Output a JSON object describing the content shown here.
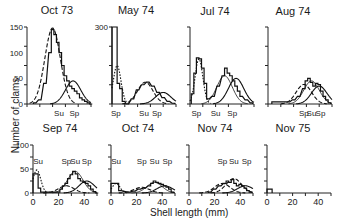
{
  "chart_data": {
    "type": "line",
    "title": "",
    "xlabel": "Shell length (mm)",
    "ylabel": "Number of clams",
    "layout": "2x4 small multiples (length-frequency histograms with fitted normal curves)",
    "xlim": [
      0,
      50
    ],
    "x_ticks": [
      0,
      20,
      40
    ],
    "legend": "none; curves labeled by cohort: Sp (spring), Su (summer)",
    "panels": [
      {
        "title": "Oct 73",
        "ylim": [
          0,
          150
        ],
        "y_ticks": [
          0,
          50,
          100,
          150
        ],
        "cohort_labels": [
          "Su",
          "Sp"
        ],
        "histogram": {
          "x": [
            6,
            10,
            14,
            18,
            20,
            22,
            24,
            26,
            28,
            30,
            32,
            34,
            36,
            38,
            40,
            42,
            44,
            46,
            48,
            50
          ],
          "y": [
            2,
            8,
            40,
            100,
            145,
            135,
            120,
            100,
            75,
            55,
            45,
            35,
            30,
            25,
            20,
            12,
            8,
            5,
            2,
            0
          ]
        },
        "fitted_curves": [
          {
            "cohort": "Su",
            "style": "dashed",
            "mean": 20,
            "peak": 148
          },
          {
            "cohort": "Sp",
            "style": "solid",
            "mean": 36,
            "peak": 45
          }
        ]
      },
      {
        "title": "May 74",
        "ylim": [
          0,
          300
        ],
        "y_ticks": [
          300
        ],
        "axis_break": true,
        "cohort_labels": [
          "Sp",
          "Su",
          "Sp"
        ],
        "histogram": {
          "x": [
            1,
            3,
            5,
            7,
            9,
            12,
            16,
            20,
            24,
            28,
            32,
            36,
            40,
            44,
            48
          ],
          "y": [
            300,
            300,
            80,
            60,
            10,
            0,
            20,
            55,
            75,
            85,
            70,
            45,
            25,
            10,
            3
          ]
        },
        "fitted_curves": [
          {
            "cohort": "Sp",
            "style": "dotted",
            "mean": 4,
            "peak": 150
          },
          {
            "cohort": "Su",
            "style": "dashed",
            "mean": 26,
            "peak": 85
          },
          {
            "cohort": "Sp",
            "style": "solid",
            "mean": 40,
            "peak": 45
          }
        ]
      },
      {
        "title": "Jul 74",
        "ylim": [
          0,
          150
        ],
        "y_ticks": [
          0,
          50,
          100,
          150
        ],
        "cohort_labels": [
          "Sp",
          "Su",
          "Sp"
        ],
        "histogram": {
          "x": [
            2,
            4,
            6,
            8,
            10,
            12,
            14,
            18,
            22,
            26,
            28,
            30,
            32,
            34,
            36,
            38,
            40,
            44,
            48
          ],
          "y": [
            20,
            60,
            90,
            88,
            70,
            40,
            10,
            15,
            35,
            55,
            70,
            60,
            55,
            45,
            35,
            25,
            15,
            8,
            2
          ]
        },
        "fitted_curves": [
          {
            "cohort": "Sp",
            "style": "dotted",
            "mean": 7,
            "peak": 88
          },
          {
            "cohort": "Su",
            "style": "thin-solid",
            "mean": 27,
            "peak": 55
          },
          {
            "cohort": "Sp",
            "style": "solid",
            "mean": 36,
            "peak": 50
          }
        ]
      },
      {
        "title": "Aug 74",
        "ylim": [
          0,
          150
        ],
        "y_ticks": [
          0,
          50,
          100,
          150
        ],
        "cohort_labels": [
          "Sp",
          "Su",
          "Sp"
        ],
        "histogram": {
          "x": [
            4,
            8,
            12,
            16,
            20,
            24,
            28,
            30,
            32,
            34,
            36,
            38,
            40,
            42,
            44,
            46,
            48
          ],
          "y": [
            4,
            4,
            4,
            4,
            8,
            15,
            30,
            45,
            50,
            42,
            35,
            40,
            38,
            25,
            15,
            8,
            2
          ]
        },
        "fitted_curves": [
          {
            "cohort": "Sp",
            "style": "dashed",
            "mean": 28,
            "peak": 38
          },
          {
            "cohort": "Su",
            "style": "thin-solid",
            "mean": 34,
            "peak": 45
          },
          {
            "cohort": "Sp",
            "style": "solid",
            "mean": 40,
            "peak": 35
          }
        ]
      },
      {
        "title": "Sep 74",
        "ylim": [
          0,
          100
        ],
        "y_ticks": [
          0,
          50,
          100
        ],
        "cohort_labels": [
          "Su",
          "Sp",
          "Su",
          "Sp"
        ],
        "histogram": {
          "x": [
            1,
            3,
            5,
            7,
            20,
            22,
            24,
            26,
            28,
            30,
            32,
            34,
            36,
            38,
            40,
            42,
            44,
            46,
            48,
            50
          ],
          "y": [
            40,
            40,
            10,
            2,
            2,
            8,
            15,
            20,
            30,
            38,
            45,
            40,
            30,
            25,
            22,
            20,
            15,
            8,
            3,
            0
          ]
        },
        "fitted_curves": [
          {
            "cohort": "Su",
            "style": "dotted",
            "mean": 3,
            "peak": 48
          },
          {
            "cohort": "Sp",
            "style": "dashed",
            "mean": 26,
            "peak": 15
          },
          {
            "cohort": "Su",
            "style": "thin-solid",
            "mean": 33,
            "peak": 45
          },
          {
            "cohort": "Sp",
            "style": "solid",
            "mean": 42,
            "peak": 25
          }
        ]
      },
      {
        "title": "Oct 74",
        "ylim": [
          0,
          100
        ],
        "y_ticks": [
          0,
          50,
          100
        ],
        "cohort_labels": [
          "Su",
          "Sp",
          "Su",
          "Sp"
        ],
        "histogram": {
          "x": [
            1,
            3,
            5,
            7,
            14,
            18,
            22,
            26,
            30,
            32,
            34,
            36,
            38,
            40,
            42,
            44,
            46,
            48
          ],
          "y": [
            20,
            20,
            20,
            5,
            2,
            4,
            8,
            10,
            15,
            20,
            25,
            22,
            20,
            18,
            15,
            12,
            8,
            2
          ]
        },
        "fitted_curves": [
          {
            "cohort": "Su",
            "style": "dotted",
            "mean": 4,
            "peak": 20
          },
          {
            "cohort": "Sp",
            "style": "dashed",
            "mean": 24,
            "peak": 12
          },
          {
            "cohort": "Su",
            "style": "thin-solid",
            "mean": 34,
            "peak": 22
          },
          {
            "cohort": "Sp",
            "style": "solid",
            "mean": 42,
            "peak": 15
          }
        ]
      },
      {
        "title": "Nov 74",
        "ylim": [
          0,
          100
        ],
        "y_ticks": [
          0,
          50,
          100
        ],
        "cohort_labels": [
          "Sp",
          "Su",
          "Sp"
        ],
        "histogram": {
          "x": [
            16,
            20,
            24,
            28,
            30,
            32,
            34,
            36,
            38,
            40,
            42,
            44,
            46,
            48
          ],
          "y": [
            2,
            8,
            15,
            20,
            25,
            22,
            28,
            20,
            15,
            18,
            15,
            10,
            5,
            2
          ]
        },
        "fitted_curves": [
          {
            "cohort": "Sp",
            "style": "dashed",
            "mean": 26,
            "peak": 20
          },
          {
            "cohort": "Su",
            "style": "dashed",
            "mean": 35,
            "peak": 30
          },
          {
            "cohort": "Sp",
            "style": "solid",
            "mean": 44,
            "peak": 15
          }
        ]
      },
      {
        "title": "Nov 75",
        "ylim": [
          0,
          100
        ],
        "y_ticks": [
          0,
          50,
          100
        ],
        "cohort_labels": [],
        "histogram": {
          "x": [
            1,
            3
          ],
          "y": [
            8,
            8
          ]
        },
        "fitted_curves": []
      }
    ]
  },
  "labels": {
    "ylabel": "Number of clams",
    "xlabel": "Shell length (mm)",
    "titles": [
      "Oct 73",
      "May 74",
      "Jul 74",
      "Aug 74",
      "Sep 74",
      "Oct 74",
      "Nov 74",
      "Nov 75"
    ]
  }
}
